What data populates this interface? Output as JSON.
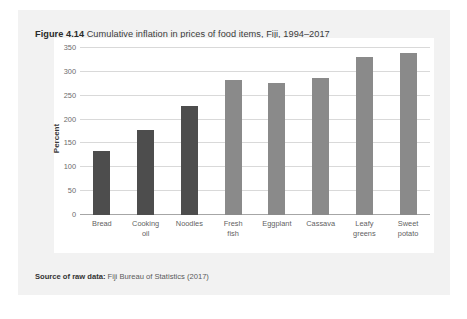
{
  "figure": {
    "number": "Figure 4.14",
    "title": "Cumulative inflation in prices of food items, Fiji, 1994–2017",
    "source_label": "Source of raw data:",
    "source_text": "Fiji Bureau of Statistics (2017)"
  },
  "colors": {
    "panel_background": "#f2f2f2",
    "plot_background": "#ffffff",
    "bar_dark": "#4d4d4d",
    "bar_light": "#8a8a8a",
    "gridline": "#d9d9d9",
    "axis": "#a6a6a6"
  },
  "chart_data": {
    "type": "bar",
    "title": "Cumulative inflation in prices of food items, Fiji, 1994–2017",
    "xlabel": "",
    "ylabel": "Percent",
    "ylim": [
      0,
      350
    ],
    "yticks": [
      0,
      50,
      100,
      150,
      200,
      250,
      300,
      350
    ],
    "ytick_labels": [
      "0",
      "50",
      "100",
      "150",
      "200",
      "250",
      "300",
      "350"
    ],
    "grid": true,
    "legend": "none",
    "categories": [
      "Bread",
      "Cooking oil",
      "Noodles",
      "Fresh fish",
      "Eggplant",
      "Cassava",
      "Leafy greens",
      "Sweet potato"
    ],
    "category_lines": [
      [
        "Bread"
      ],
      [
        "Cooking",
        "oil"
      ],
      [
        "Noodles"
      ],
      [
        "Fresh",
        "fish"
      ],
      [
        "Eggplant"
      ],
      [
        "Cassava"
      ],
      [
        "Leafy",
        "greens"
      ],
      [
        "Sweet",
        "potato"
      ]
    ],
    "values": [
      134,
      178,
      229,
      283,
      277,
      287,
      331,
      340
    ],
    "bar_shades": [
      "dark",
      "dark",
      "dark",
      "light",
      "light",
      "light",
      "light",
      "light"
    ]
  }
}
